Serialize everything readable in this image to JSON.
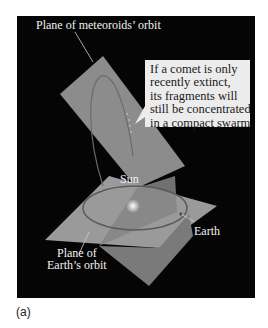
{
  "figure": {
    "labels": {
      "meteoroid_plane": "Plane of meteoroids’ orbit",
      "sun": "Sun",
      "earth": "Earth",
      "earth_plane_line1": "Plane of",
      "earth_plane_line2": "Earth’s orbit"
    },
    "callout": {
      "lines": [
        "If a comet is only",
        "recently extinct,",
        "its fragments will",
        "still be concentrated",
        "in a compact swarm."
      ]
    },
    "caption": "(a)",
    "colors": {
      "background": "#050505",
      "plane": "#8a8a8a",
      "callout_bg": "#ececec",
      "label_text": "#f2f2f2"
    }
  }
}
